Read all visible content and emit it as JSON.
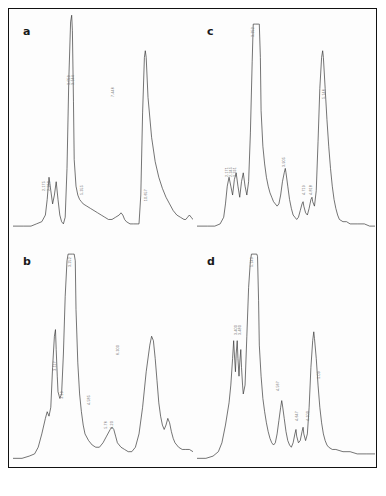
{
  "figure": {
    "type": "chromatogram-panel-figure",
    "border_color": "#111111",
    "background": "#ffffff",
    "trace_color": "#3a3a3a",
    "label_color": "#6a6a6a",
    "panels_layout": "2x2"
  },
  "panels": [
    {
      "id": "a",
      "label": "a",
      "peak_labels": [
        "2.175",
        "2.260",
        "3.059",
        "3.144",
        "5.355",
        "7.446",
        "10.657"
      ]
    },
    {
      "id": "b",
      "label": "b",
      "peak_labels": [
        "3.252",
        "3.117",
        "3.19",
        "4.585",
        "5.76",
        "6.20",
        "6.300"
      ]
    },
    {
      "id": "c",
      "label": "c",
      "peak_labels": [
        "3.252",
        "2.171",
        "2.245",
        "2.331",
        "3.905",
        "4.719",
        "4.818",
        "5.146"
      ]
    },
    {
      "id": "d",
      "label": "d",
      "peak_labels": [
        "5.143",
        "3.400",
        "3.480",
        "4.567",
        "4.647",
        "4.100",
        "5.09"
      ]
    }
  ],
  "chart_data": {
    "type": "line",
    "title": "",
    "xlabel": "",
    "ylabel": "",
    "grid": false,
    "legend": "none",
    "axis_visible": false,
    "series": [
      {
        "name": "a",
        "panel": "a",
        "xlim": [
          0,
          100
        ],
        "ylim": [
          0,
          100
        ],
        "points": [
          [
            0,
            4
          ],
          [
            6,
            4
          ],
          [
            10,
            4
          ],
          [
            13,
            5
          ],
          [
            16,
            6
          ],
          [
            18,
            9
          ],
          [
            19,
            16
          ],
          [
            20,
            26
          ],
          [
            21,
            20
          ],
          [
            22,
            14
          ],
          [
            23,
            18
          ],
          [
            24,
            24
          ],
          [
            25,
            16
          ],
          [
            26,
            9
          ],
          [
            27,
            6
          ],
          [
            28,
            5
          ],
          [
            29,
            8
          ],
          [
            30,
            30
          ],
          [
            31,
            70
          ],
          [
            32,
            96
          ],
          [
            32.6,
            99
          ],
          [
            33,
            92
          ],
          [
            33.6,
            60
          ],
          [
            34,
            34
          ],
          [
            35,
            22
          ],
          [
            36,
            18
          ],
          [
            37,
            16
          ],
          [
            38,
            15
          ],
          [
            39,
            14
          ],
          [
            41,
            13
          ],
          [
            43,
            12
          ],
          [
            45,
            11
          ],
          [
            47,
            10
          ],
          [
            49,
            9
          ],
          [
            51,
            8
          ],
          [
            53,
            7
          ],
          [
            55,
            7
          ],
          [
            57,
            8
          ],
          [
            59,
            9
          ],
          [
            60,
            10
          ],
          [
            61,
            9
          ],
          [
            62,
            7
          ],
          [
            63,
            6
          ],
          [
            65,
            5
          ],
          [
            67,
            5
          ],
          [
            69,
            5
          ],
          [
            70,
            5
          ],
          [
            71,
            18
          ],
          [
            72,
            55
          ],
          [
            73,
            80
          ],
          [
            73.5,
            83
          ],
          [
            74,
            80
          ],
          [
            75,
            62
          ],
          [
            77,
            44
          ],
          [
            79,
            33
          ],
          [
            81,
            26
          ],
          [
            83,
            21
          ],
          [
            85,
            17
          ],
          [
            87,
            14
          ],
          [
            89,
            11
          ],
          [
            91,
            9
          ],
          [
            93,
            8
          ],
          [
            95,
            7
          ],
          [
            96,
            7
          ],
          [
            97,
            8
          ],
          [
            98,
            9
          ],
          [
            99,
            8
          ],
          [
            100,
            7
          ]
        ]
      },
      {
        "name": "b",
        "panel": "b",
        "xlim": [
          0,
          100
        ],
        "ylim": [
          0,
          100
        ],
        "points": [
          [
            0,
            3
          ],
          [
            5,
            3
          ],
          [
            9,
            4
          ],
          [
            12,
            5
          ],
          [
            14,
            8
          ],
          [
            16,
            14
          ],
          [
            18,
            21
          ],
          [
            19,
            24
          ],
          [
            20,
            22
          ],
          [
            21,
            26
          ],
          [
            22,
            44
          ],
          [
            23,
            58
          ],
          [
            23.6,
            61
          ],
          [
            24,
            52
          ],
          [
            24.6,
            40
          ],
          [
            25,
            33
          ],
          [
            26,
            30
          ],
          [
            27,
            32
          ],
          [
            28,
            50
          ],
          [
            29,
            76
          ],
          [
            30,
            92
          ],
          [
            30.6,
            95
          ],
          [
            33,
            95
          ],
          [
            34,
            95
          ],
          [
            34.6,
            92
          ],
          [
            35,
            70
          ],
          [
            36,
            46
          ],
          [
            37,
            32
          ],
          [
            38,
            24
          ],
          [
            39,
            18
          ],
          [
            40,
            14
          ],
          [
            42,
            11
          ],
          [
            44,
            9
          ],
          [
            46,
            8
          ],
          [
            48,
            8
          ],
          [
            50,
            10
          ],
          [
            52,
            13
          ],
          [
            54,
            16
          ],
          [
            55,
            17
          ],
          [
            56,
            16
          ],
          [
            57,
            13
          ],
          [
            58,
            10
          ],
          [
            60,
            8
          ],
          [
            62,
            7
          ],
          [
            64,
            6
          ],
          [
            66,
            6
          ],
          [
            68,
            8
          ],
          [
            70,
            14
          ],
          [
            72,
            26
          ],
          [
            74,
            42
          ],
          [
            76,
            54
          ],
          [
            77,
            58
          ],
          [
            78,
            56
          ],
          [
            79,
            48
          ],
          [
            80,
            38
          ],
          [
            81,
            28
          ],
          [
            82,
            22
          ],
          [
            83,
            18
          ],
          [
            84,
            16
          ],
          [
            85,
            18
          ],
          [
            86,
            21
          ],
          [
            87,
            19
          ],
          [
            88,
            15
          ],
          [
            89,
            12
          ],
          [
            90,
            10
          ],
          [
            92,
            8
          ],
          [
            94,
            7
          ],
          [
            96,
            7
          ],
          [
            98,
            7
          ],
          [
            100,
            6
          ]
        ]
      },
      {
        "name": "c",
        "panel": "c",
        "xlim": [
          0,
          100
        ],
        "ylim": [
          0,
          100
        ],
        "points": [
          [
            0,
            4
          ],
          [
            6,
            4
          ],
          [
            10,
            4
          ],
          [
            13,
            5
          ],
          [
            15,
            8
          ],
          [
            16,
            14
          ],
          [
            17,
            22
          ],
          [
            18,
            26
          ],
          [
            19,
            22
          ],
          [
            20,
            18
          ],
          [
            21,
            25
          ],
          [
            22,
            28
          ],
          [
            23,
            22
          ],
          [
            24,
            17
          ],
          [
            25,
            24
          ],
          [
            26,
            28
          ],
          [
            27,
            22
          ],
          [
            28,
            18
          ],
          [
            29,
            24
          ],
          [
            30,
            46
          ],
          [
            31,
            78
          ],
          [
            31.6,
            95
          ],
          [
            33,
            95
          ],
          [
            34.6,
            95
          ],
          [
            35,
            95
          ],
          [
            35.6,
            80
          ],
          [
            36,
            56
          ],
          [
            37,
            40
          ],
          [
            38,
            32
          ],
          [
            39,
            26
          ],
          [
            40,
            22
          ],
          [
            41,
            19
          ],
          [
            42,
            17
          ],
          [
            43,
            15
          ],
          [
            44,
            14
          ],
          [
            45,
            13
          ],
          [
            46,
            14
          ],
          [
            47,
            18
          ],
          [
            48,
            24
          ],
          [
            49,
            28
          ],
          [
            49.6,
            30
          ],
          [
            50,
            28
          ],
          [
            51,
            22
          ],
          [
            52,
            16
          ],
          [
            53,
            12
          ],
          [
            54,
            9
          ],
          [
            55,
            8
          ],
          [
            56,
            7
          ],
          [
            57,
            8
          ],
          [
            58,
            11
          ],
          [
            59,
            14
          ],
          [
            59.6,
            15
          ],
          [
            60,
            13
          ],
          [
            61,
            10
          ],
          [
            62,
            9
          ],
          [
            63,
            12
          ],
          [
            64,
            16
          ],
          [
            64.6,
            17
          ],
          [
            65,
            15
          ],
          [
            66,
            13
          ],
          [
            67,
            20
          ],
          [
            68,
            42
          ],
          [
            69,
            66
          ],
          [
            70,
            80
          ],
          [
            70.6,
            83
          ],
          [
            71,
            80
          ],
          [
            72,
            66
          ],
          [
            73,
            52
          ],
          [
            74,
            40
          ],
          [
            75,
            30
          ],
          [
            76,
            22
          ],
          [
            77,
            16
          ],
          [
            78,
            12
          ],
          [
            79,
            9
          ],
          [
            80,
            7
          ],
          [
            82,
            6
          ],
          [
            84,
            6
          ],
          [
            86,
            5
          ],
          [
            90,
            5
          ],
          [
            94,
            5
          ],
          [
            97,
            4
          ],
          [
            100,
            4
          ]
        ]
      },
      {
        "name": "d",
        "panel": "d",
        "xlim": [
          0,
          100
        ],
        "ylim": [
          0,
          100
        ],
        "points": [
          [
            0,
            3
          ],
          [
            5,
            3
          ],
          [
            9,
            4
          ],
          [
            12,
            6
          ],
          [
            14,
            10
          ],
          [
            16,
            18
          ],
          [
            18,
            28
          ],
          [
            19,
            36
          ],
          [
            20,
            48
          ],
          [
            20.6,
            56
          ],
          [
            21,
            50
          ],
          [
            21.6,
            42
          ],
          [
            22,
            50
          ],
          [
            22.6,
            56
          ],
          [
            23,
            48
          ],
          [
            23.6,
            40
          ],
          [
            24,
            46
          ],
          [
            24.6,
            52
          ],
          [
            25,
            44
          ],
          [
            25.6,
            36
          ],
          [
            26,
            32
          ],
          [
            27,
            36
          ],
          [
            28,
            58
          ],
          [
            29,
            80
          ],
          [
            30,
            92
          ],
          [
            30.6,
            95
          ],
          [
            32,
            95
          ],
          [
            33.6,
            95
          ],
          [
            34,
            94
          ],
          [
            34.6,
            74
          ],
          [
            35,
            54
          ],
          [
            36,
            40
          ],
          [
            37,
            30
          ],
          [
            38,
            24
          ],
          [
            39,
            19
          ],
          [
            40,
            15
          ],
          [
            41,
            12
          ],
          [
            42,
            10
          ],
          [
            43,
            9
          ],
          [
            44,
            10
          ],
          [
            45,
            14
          ],
          [
            46,
            20
          ],
          [
            47,
            26
          ],
          [
            47.6,
            29
          ],
          [
            48,
            27
          ],
          [
            49,
            21
          ],
          [
            50,
            15
          ],
          [
            51,
            11
          ],
          [
            52,
            9
          ],
          [
            53,
            8
          ],
          [
            54,
            10
          ],
          [
            55,
            14
          ],
          [
            55.6,
            16
          ],
          [
            56,
            13
          ],
          [
            57,
            10
          ],
          [
            58,
            11
          ],
          [
            59,
            15
          ],
          [
            59.6,
            17
          ],
          [
            60,
            14
          ],
          [
            61,
            11
          ],
          [
            62,
            14
          ],
          [
            63,
            26
          ],
          [
            64,
            44
          ],
          [
            65,
            56
          ],
          [
            65.6,
            60
          ],
          [
            66,
            57
          ],
          [
            67,
            48
          ],
          [
            68,
            36
          ],
          [
            69,
            26
          ],
          [
            70,
            19
          ],
          [
            71,
            14
          ],
          [
            72,
            11
          ],
          [
            73,
            9
          ],
          [
            74,
            8
          ],
          [
            76,
            7
          ],
          [
            78,
            7
          ],
          [
            82,
            6
          ],
          [
            86,
            6
          ],
          [
            90,
            5
          ],
          [
            95,
            5
          ],
          [
            100,
            5
          ]
        ]
      }
    ]
  }
}
